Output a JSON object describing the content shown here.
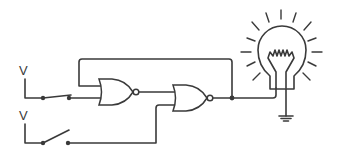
{
  "diagram": {
    "type": "logic-circuit",
    "colors": {
      "line": "#3a3a3a",
      "background": "#ffffff"
    },
    "sources": [
      {
        "id": "source-1",
        "label": "V",
        "switch_state": "closed"
      },
      {
        "id": "source-2",
        "label": "V",
        "switch_state": "open"
      }
    ],
    "gates": [
      {
        "id": "gate-1",
        "type": "NOR"
      },
      {
        "id": "gate-2",
        "type": "NOR"
      }
    ],
    "output": {
      "device": "light-bulb",
      "state": "lit",
      "ground": true
    },
    "feedback": "gate-2 output loops back to gate-1 input"
  }
}
